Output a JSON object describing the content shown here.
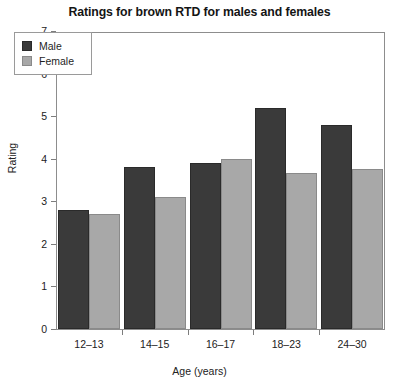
{
  "chart_data": {
    "type": "bar",
    "title": "Ratings for brown RTD for males and females",
    "xlabel": "Age (years)",
    "ylabel": "Rating",
    "categories": [
      "12–13",
      "14–15",
      "16–17",
      "18–23",
      "24–30"
    ],
    "series": [
      {
        "name": "Male",
        "values": [
          2.8,
          3.8,
          3.9,
          5.2,
          4.8
        ],
        "color": "#3a3a3a"
      },
      {
        "name": "Female",
        "values": [
          2.7,
          3.1,
          4.0,
          3.67,
          3.77
        ],
        "color": "#a8a8a8"
      }
    ],
    "ylim": [
      0,
      7
    ],
    "yticks": [
      0,
      1,
      2,
      3,
      4,
      5,
      6,
      7
    ],
    "ytick_labels": [
      "0",
      "1",
      "2",
      "3",
      "4",
      "5",
      "6",
      "7"
    ],
    "grid": false,
    "legend_position": "upper left",
    "legend_entries": [
      "Male",
      "Female"
    ]
  }
}
